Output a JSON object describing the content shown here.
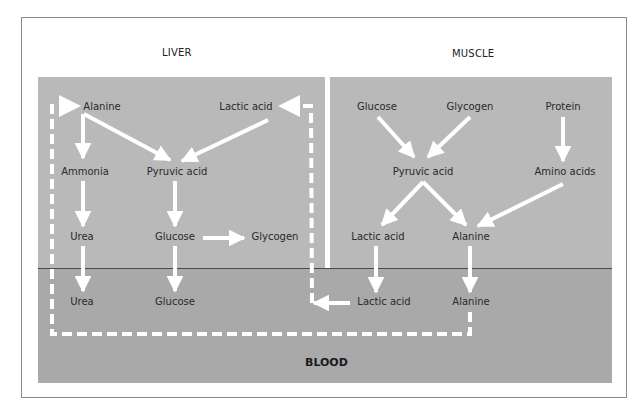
{
  "regions": {
    "liver": "LIVER",
    "muscle": "MUSCLE",
    "blood": "BLOOD"
  },
  "colors": {
    "panel_top": "#b9b9b9",
    "panel_bottom": "#a9a9a9",
    "arrows": "#ffffff",
    "divider_line": "#4a4a4a"
  },
  "nodes": {
    "liver": {
      "alanine": "Alanine",
      "lactic_acid": "Lactic acid",
      "ammonia": "Ammonia",
      "pyruvic_acid": "Pyruvic acid",
      "urea": "Urea",
      "glucose": "Glucose",
      "glycogen": "Glycogen"
    },
    "muscle": {
      "glucose": "Glucose",
      "glycogen": "Glycogen",
      "protein": "Protein",
      "pyruvic_acid": "Pyruvic acid",
      "amino_acids": "Amino acids",
      "lactic_acid": "Lactic acid",
      "alanine": "Alanine"
    },
    "blood": {
      "urea": "Urea",
      "glucose": "Glucose",
      "lactic_acid": "Lactic acid",
      "alanine": "Alanine"
    }
  },
  "edges": [
    {
      "from": "liver.alanine",
      "to": "liver.ammonia",
      "style": "solid"
    },
    {
      "from": "liver.alanine",
      "to": "liver.pyruvic_acid",
      "style": "solid"
    },
    {
      "from": "liver.lactic_acid",
      "to": "liver.pyruvic_acid",
      "style": "solid"
    },
    {
      "from": "liver.ammonia",
      "to": "liver.urea",
      "style": "solid"
    },
    {
      "from": "liver.pyruvic_acid",
      "to": "liver.glucose",
      "style": "solid"
    },
    {
      "from": "liver.glucose",
      "to": "liver.glycogen",
      "style": "solid"
    },
    {
      "from": "liver.urea",
      "to": "blood.urea",
      "style": "solid"
    },
    {
      "from": "liver.glucose",
      "to": "blood.glucose",
      "style": "solid"
    },
    {
      "from": "muscle.glucose",
      "to": "muscle.pyruvic_acid",
      "style": "solid"
    },
    {
      "from": "muscle.glycogen",
      "to": "muscle.pyruvic_acid",
      "style": "solid"
    },
    {
      "from": "muscle.protein",
      "to": "muscle.amino_acids",
      "style": "solid"
    },
    {
      "from": "muscle.pyruvic_acid",
      "to": "muscle.lactic_acid",
      "style": "solid"
    },
    {
      "from": "muscle.pyruvic_acid",
      "to": "muscle.alanine",
      "style": "solid"
    },
    {
      "from": "muscle.amino_acids",
      "to": "muscle.alanine",
      "style": "solid"
    },
    {
      "from": "muscle.lactic_acid",
      "to": "blood.lactic_acid",
      "style": "solid"
    },
    {
      "from": "muscle.alanine",
      "to": "blood.alanine",
      "style": "solid"
    },
    {
      "from": "blood.lactic_acid",
      "to": "liver.lactic_acid",
      "style": "dashed"
    },
    {
      "from": "blood.alanine",
      "to": "liver.alanine",
      "style": "dashed"
    }
  ]
}
